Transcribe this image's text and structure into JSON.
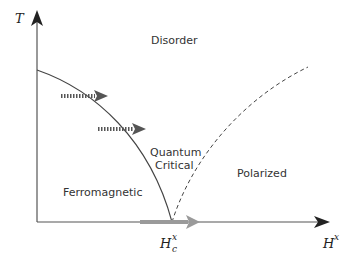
{
  "diagram": {
    "type": "phase-diagram",
    "axes": {
      "y": {
        "label": "T"
      },
      "x": {
        "label": "H",
        "label_sup": "x"
      },
      "critical_point": {
        "label": "H",
        "label_sup": "x",
        "label_sub": "c"
      }
    },
    "regions": {
      "disorder": "Disorder",
      "quantum_critical_line1": "Quantum",
      "quantum_critical_line2": "Critical",
      "ferromagnetic": "Ferromagnetic",
      "polarized": "Polarized"
    },
    "curves": [
      {
        "name": "phase-boundary",
        "style": "solid",
        "from": "T-axis intercept",
        "to": "H_c^x"
      },
      {
        "name": "crossover-line",
        "style": "dashed",
        "from": "H_c^x",
        "to": "upper right"
      }
    ],
    "arrows": [
      {
        "name": "thermal-crossing-arrow-upper",
        "style": "dotted",
        "color": "#555555"
      },
      {
        "name": "thermal-crossing-arrow-lower",
        "style": "dotted",
        "color": "#555555"
      },
      {
        "name": "quantum-tuning-arrow",
        "style": "solid-thick",
        "color": "#999999"
      }
    ],
    "colors": {
      "axis": "#333333",
      "curve": "#444444",
      "dotted_arrow": "#555555",
      "gray_arrow": "#9a9a9a"
    }
  }
}
